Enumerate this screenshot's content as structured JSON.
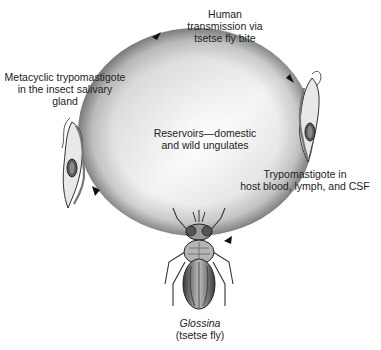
{
  "diagram": {
    "cycle_direction": "clockwise",
    "labels": {
      "top": {
        "lines": [
          "Human",
          "transmission via",
          "tsetse fly bite"
        ]
      },
      "left": {
        "lines": [
          "Metacyclic trypomastigote",
          "in the insect salivary",
          "gland"
        ]
      },
      "center": {
        "lines": [
          "Reservoirs—domestic",
          "and wild ungulates"
        ]
      },
      "right": {
        "lines": [
          "Trypomastigote in",
          "host blood, lymph, and CSF"
        ]
      },
      "bottom": {
        "genus": "Glossina",
        "common_name": "(tsetse fly)"
      }
    },
    "nodes": [
      {
        "id": "metacyclic-trypomastigote",
        "icon": "trypomastigote-icon",
        "position": "left"
      },
      {
        "id": "bloodstream-trypomastigote",
        "icon": "trypomastigote-icon",
        "position": "right"
      },
      {
        "id": "tsetse-fly",
        "icon": "fly-icon",
        "position": "bottom"
      }
    ],
    "arrows": [
      {
        "from": "metacyclic-trypomastigote",
        "to": "human-transmission",
        "position": "upper-left"
      },
      {
        "from": "human-transmission",
        "to": "bloodstream-trypomastigote",
        "position": "upper-right"
      },
      {
        "from": "bloodstream-trypomastigote",
        "to": "tsetse-fly",
        "position": "lower-right"
      },
      {
        "from": "tsetse-fly",
        "to": "metacyclic-trypomastigote",
        "position": "lower-left"
      }
    ],
    "colors": {
      "ring_light": "#ffffff",
      "ring_dark": "#8a8a8a",
      "ink": "#222222"
    }
  }
}
